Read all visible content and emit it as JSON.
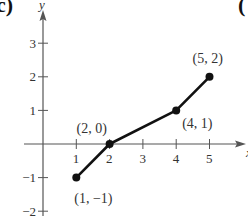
{
  "panel": {
    "label_left": "c)",
    "label_right": "("
  },
  "chart_data": {
    "type": "line",
    "title": "",
    "xlabel": "x",
    "ylabel": "y",
    "xlim": [
      -0.6,
      6.2
    ],
    "ylim": [
      -2.1,
      3.9
    ],
    "grid": false,
    "x_ticks": [
      1,
      2,
      3,
      4,
      5
    ],
    "y_ticks": [
      -2,
      -1,
      1,
      2,
      3
    ],
    "x_tick_labels": [
      "1",
      "2",
      "3",
      "4",
      "5"
    ],
    "y_tick_labels": [
      "−2",
      "−1",
      "1",
      "2",
      "3"
    ],
    "series": [
      {
        "name": "piecewise linear",
        "x": [
          1,
          2,
          4,
          5
        ],
        "y": [
          -1,
          0,
          1,
          2
        ]
      }
    ],
    "annotations": [
      {
        "text": "(1,  −1)",
        "x": 1,
        "y": -1
      },
      {
        "text": "(2,  0)",
        "x": 2,
        "y": 0
      },
      {
        "text": "(4,  1)",
        "x": 4,
        "y": 1
      },
      {
        "text": "(5,  2)",
        "x": 5,
        "y": 2
      }
    ]
  }
}
